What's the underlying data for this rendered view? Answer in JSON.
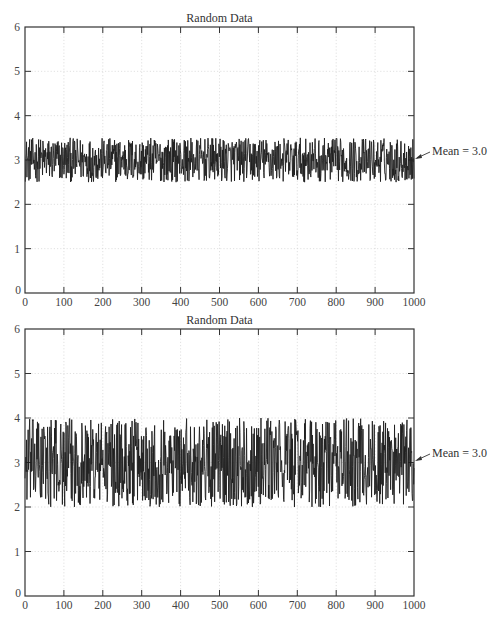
{
  "chart_data": [
    {
      "type": "line",
      "title": "Random Data",
      "xlabel": "",
      "ylabel": "",
      "xlim": [
        0,
        1000
      ],
      "ylim": [
        0,
        6
      ],
      "xticks": [
        0,
        100,
        200,
        300,
        400,
        500,
        600,
        700,
        800,
        900,
        1000
      ],
      "yticks": [
        0,
        1,
        2,
        3,
        4,
        5,
        6
      ],
      "grid": true,
      "series": [
        {
          "name": "random",
          "n_points": 1000,
          "mean": 3.0,
          "min": 2.5,
          "max": 3.5,
          "distribution": "uniform noise, amplitude ±0.5"
        }
      ],
      "annotations": [
        {
          "text": "Mean = 3.0",
          "x": 1000,
          "y": 3.0,
          "arrow": true
        }
      ]
    },
    {
      "type": "line",
      "title": "Random Data",
      "xlabel": "",
      "ylabel": "",
      "xlim": [
        0,
        1000
      ],
      "ylim": [
        0,
        6
      ],
      "xticks": [
        0,
        100,
        200,
        300,
        400,
        500,
        600,
        700,
        800,
        900,
        1000
      ],
      "yticks": [
        0,
        1,
        2,
        3,
        4,
        5,
        6
      ],
      "grid": true,
      "series": [
        {
          "name": "random",
          "n_points": 1000,
          "mean": 3.0,
          "min": 2.0,
          "max": 4.0,
          "distribution": "uniform noise, amplitude ±1.0"
        }
      ],
      "annotations": [
        {
          "text": "Mean = 3.0",
          "x": 1000,
          "y": 3.0,
          "arrow": true
        }
      ]
    }
  ],
  "plots": [
    {
      "title": "Random Data",
      "annotation": "Mean = 3.0",
      "xtick_labels": [
        "0",
        "100",
        "200",
        "300",
        "400",
        "500",
        "600",
        "700",
        "800",
        "900",
        "1000"
      ],
      "ytick_labels": [
        "0",
        "1",
        "2",
        "3",
        "4",
        "5",
        "6"
      ]
    },
    {
      "title": "Random Data",
      "annotation": "Mean = 3.0",
      "xtick_labels": [
        "0",
        "100",
        "200",
        "300",
        "400",
        "500",
        "600",
        "700",
        "800",
        "900",
        "1000"
      ],
      "ytick_labels": [
        "0",
        "1",
        "2",
        "3",
        "4",
        "5",
        "6"
      ]
    }
  ],
  "colors": {
    "line": "#1e1e1e",
    "axis": "#333333",
    "grid": "#d4d4d4",
    "background": "#ffffff"
  }
}
